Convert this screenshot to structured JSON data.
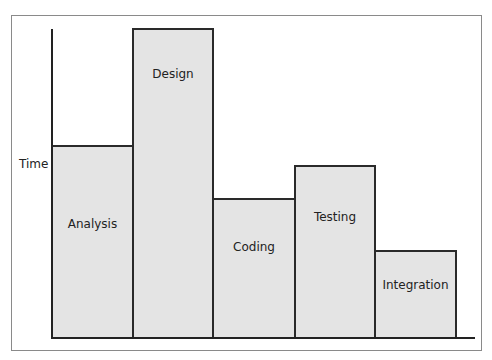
{
  "chart_data": {
    "type": "bar",
    "title": "",
    "xlabel": "",
    "ylabel": "Time",
    "categories": [
      "Analysis",
      "Design",
      "Coding",
      "Testing",
      "Integration"
    ],
    "values": [
      193,
      311,
      141,
      174,
      89
    ],
    "units": "relative pixel height (no numeric axis shown)",
    "grid": false,
    "legend": null
  },
  "diagram": {
    "y_axis_label": "Time",
    "bars": [
      {
        "label": "Analysis",
        "left": 51,
        "top": 145,
        "width": 81,
        "label_y": 70
      },
      {
        "label": "Design",
        "left": 132,
        "top": 28,
        "width": 80,
        "label_y": 37
      },
      {
        "label": "Coding",
        "left": 212,
        "top": 198,
        "width": 82,
        "label_y": 40
      },
      {
        "label": "Testing",
        "left": 294,
        "top": 165,
        "width": 80,
        "label_y": 43
      },
      {
        "label": "Integration",
        "left": 374,
        "top": 250,
        "width": 81,
        "label_y": 26
      }
    ],
    "colors": {
      "bar_fill": "#e4e4e4",
      "bar_stroke": "#2a2a2a",
      "frame": "#8a8a8a"
    }
  }
}
